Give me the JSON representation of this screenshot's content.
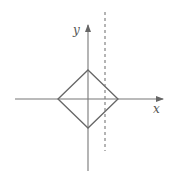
{
  "diagram": {
    "axes": {
      "x_label": "x",
      "y_label": "y",
      "color": "#666666"
    },
    "shape": {
      "type": "diamond",
      "description": "square rotated 45 degrees centered at origin",
      "color": "#666666"
    },
    "dashed_line": {
      "orientation": "vertical",
      "description": "dashed vertical line to the right of the y-axis, crossing the diamond",
      "color": "#666666"
    }
  }
}
